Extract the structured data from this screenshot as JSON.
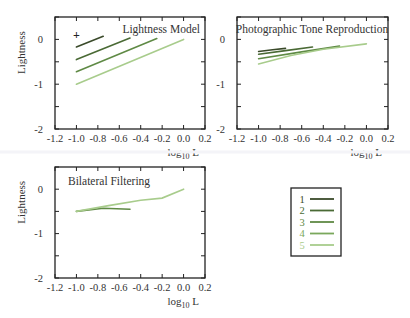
{
  "chart_data": [
    {
      "type": "line",
      "title": "Lightness Model",
      "xlabel": "log10 L",
      "ylabel": "Lightness",
      "xlim": [
        -1.2,
        0.2
      ],
      "ylim": [
        -2,
        0.5
      ],
      "xticks": [
        "-1.2",
        "-1.0",
        "-0.8",
        "-0.6",
        "-0.4",
        "-0.2",
        "0.0",
        "0.2"
      ],
      "yticks": [
        "0",
        "-1",
        "-2"
      ],
      "marker": {
        "symbol": "+",
        "x": -1.0,
        "y": 0.1
      },
      "series": [
        {
          "name": "1",
          "x": [
            -1.0,
            -0.75
          ],
          "y": [
            -0.17,
            0.07
          ]
        },
        {
          "name": "2",
          "x": [
            -1.0,
            -0.5
          ],
          "y": [
            -0.45,
            0.03
          ]
        },
        {
          "name": "3",
          "x": [
            -1.0,
            -0.25
          ],
          "y": [
            -0.72,
            0.02
          ]
        },
        {
          "name": "5",
          "x": [
            -1.0,
            0.0
          ],
          "y": [
            -1.0,
            0.0
          ]
        }
      ]
    },
    {
      "type": "line",
      "title": "Photographic Tone Reproduction",
      "xlabel": "log10 L",
      "ylabel": "",
      "xlim": [
        -1.2,
        0.2
      ],
      "ylim": [
        -2,
        0.5
      ],
      "xticks": [
        "-1.2",
        "-1.0",
        "-0.8",
        "-0.6",
        "-0.4",
        "-0.2",
        "0.0",
        "0.2"
      ],
      "yticks": [
        "0",
        "-1",
        "-2"
      ],
      "series": [
        {
          "name": "1",
          "x": [
            -1.0,
            -0.87,
            -0.75
          ],
          "y": [
            -0.27,
            -0.23,
            -0.2
          ]
        },
        {
          "name": "2",
          "x": [
            -1.0,
            -0.75,
            -0.5
          ],
          "y": [
            -0.33,
            -0.25,
            -0.17
          ]
        },
        {
          "name": "3",
          "x": [
            -1.0,
            -0.6,
            -0.25
          ],
          "y": [
            -0.43,
            -0.28,
            -0.15
          ]
        },
        {
          "name": "5",
          "x": [
            -1.0,
            -0.7,
            -0.4,
            0.0
          ],
          "y": [
            -0.55,
            -0.36,
            -0.22,
            -0.1
          ]
        }
      ]
    },
    {
      "type": "line",
      "title": "Bilateral Filtering",
      "xlabel": "log10 L",
      "ylabel": "Lightness",
      "xlim": [
        -1.2,
        0.2
      ],
      "ylim": [
        -2,
        0.5
      ],
      "xticks": [
        "-1.2",
        "-1.0",
        "-0.8",
        "-0.6",
        "-0.4",
        "-0.2",
        "0.0",
        "0.2"
      ],
      "yticks": [
        "0",
        "-1",
        "-2"
      ],
      "series": [
        {
          "name": "3",
          "x": [
            -1.0,
            -0.75,
            -0.5
          ],
          "y": [
            -0.5,
            -0.43,
            -0.45
          ]
        },
        {
          "name": "5",
          "x": [
            -1.0,
            -0.7,
            -0.4,
            -0.2,
            0.0
          ],
          "y": [
            -0.5,
            -0.37,
            -0.25,
            -0.2,
            0.0
          ]
        }
      ]
    }
  ],
  "legend": {
    "entries": [
      {
        "label": "1",
        "color": "#3a4a2a"
      },
      {
        "label": "2",
        "color": "#4a6a35"
      },
      {
        "label": "3",
        "color": "#5f8a45"
      },
      {
        "label": "4",
        "color": "#7aa85c"
      },
      {
        "label": "5",
        "color": "#a8cc8c"
      }
    ]
  },
  "colors": {
    "s1": "#3a4a2a",
    "s2": "#4a6a35",
    "s3": "#5f8a45",
    "s4": "#7aa85c",
    "s5": "#a8cc8c"
  }
}
